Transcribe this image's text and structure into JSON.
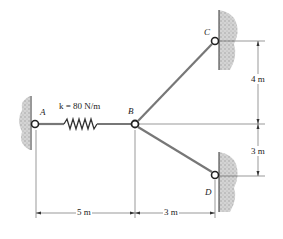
{
  "diagram": {
    "type": "spring-cable system",
    "points": {
      "A": {
        "label": "A"
      },
      "B": {
        "label": "B"
      },
      "C": {
        "label": "C"
      },
      "D": {
        "label": "D"
      }
    },
    "spring": {
      "label": "k = 80 N/m",
      "k_value": "80 N/m"
    },
    "dimensions": {
      "horizontal_AB": "5 m",
      "horizontal_BD": "3 m",
      "vertical_C": "4 m",
      "vertical_D": "3 m"
    },
    "colors": {
      "line": "#444444",
      "wall": "#b8b8b8",
      "cable": "#777777"
    }
  }
}
